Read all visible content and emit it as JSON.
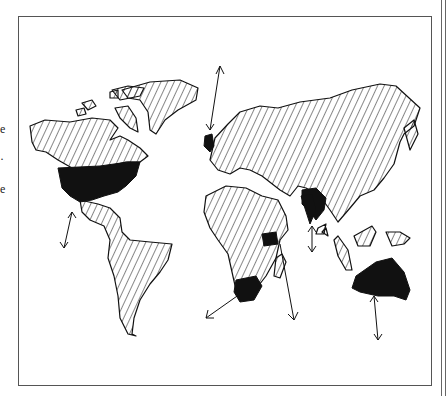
{
  "figure": {
    "type": "hand-drawn world map",
    "legend": {
      "hatched": "land (hatched)",
      "solid": "highlighted regions (solid black)"
    },
    "highlighted_regions": [
      "North America (USA)",
      "British Isles",
      "Arabian Peninsula",
      "India",
      "East Africa",
      "Southern Africa",
      "Australia"
    ],
    "arrows": [
      "Arctic from British Isles",
      "Pacific from North America",
      "South Atlantic from Southern Africa",
      "Indian Ocean from East Africa",
      "Indian Ocean from India",
      "Southern Ocean from Australia"
    ],
    "colors": {
      "ink": "#111111",
      "paper": "#ffffff",
      "frame": "#555555"
    }
  },
  "margin_fragments": [
    "e",
    "·",
    "e"
  ]
}
